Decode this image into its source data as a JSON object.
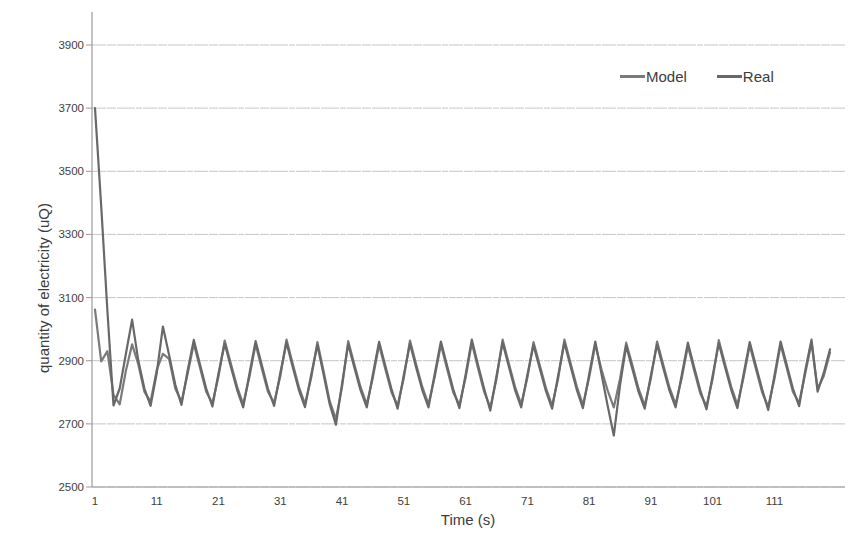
{
  "chart_data": {
    "type": "line",
    "title": "",
    "xlabel": "Time (s)",
    "ylabel": "quantity of electricity (uQ)",
    "x_start": 1,
    "x_ticks": [
      1,
      11,
      21,
      31,
      41,
      51,
      61,
      71,
      81,
      91,
      101,
      111
    ],
    "y_ticks": [
      2500,
      2700,
      2900,
      3100,
      3300,
      3500,
      3700,
      3900
    ],
    "ylim": [
      2500,
      3980
    ],
    "xlim": [
      1,
      120
    ],
    "grid": "horizontal-only",
    "legend_position": "top-right-inside",
    "colors": {
      "grid": "#c6c6c6",
      "axis": "#9b9b9b",
      "text": "#3e3e3e"
    },
    "series": [
      {
        "name": "Model",
        "color": "#7a7a7a",
        "values": [
          3062,
          2898,
          2930,
          2792,
          2762,
          2868,
          2952,
          2890,
          2802,
          2770,
          2872,
          2922,
          2906,
          2812,
          2770,
          2858,
          2954,
          2878,
          2802,
          2765,
          2850,
          2964,
          2890,
          2818,
          2762,
          2848,
          2952,
          2875,
          2802,
          2767,
          2851,
          2967,
          2892,
          2818,
          2763,
          2846,
          2959,
          2868,
          2772,
          2715,
          2818,
          2962,
          2888,
          2816,
          2762,
          2847,
          2950,
          2874,
          2800,
          2758,
          2845,
          2964,
          2888,
          2816,
          2762,
          2848,
          2951,
          2874,
          2800,
          2760,
          2846,
          2957,
          2878,
          2802,
          2752,
          2842,
          2967,
          2892,
          2818,
          2762,
          2846,
          2959,
          2886,
          2814,
          2758,
          2844,
          2967,
          2892,
          2818,
          2760,
          2846,
          2951,
          2872,
          2806,
          2752,
          2842,
          2957,
          2885,
          2812,
          2758,
          2844,
          2961,
          2888,
          2816,
          2762,
          2846,
          2947,
          2870,
          2796,
          2756,
          2842,
          2965,
          2890,
          2818,
          2760,
          2846,
          2949,
          2874,
          2800,
          2754,
          2842,
          2951,
          2876,
          2802,
          2766,
          2860,
          2957,
          2812,
          2852,
          2926
        ]
      },
      {
        "name": "Real",
        "color": "#686868",
        "values": [
          3700,
          3390,
          3058,
          2758,
          2812,
          2922,
          3030,
          2902,
          2812,
          2757,
          2862,
          3008,
          2918,
          2824,
          2760,
          2868,
          2966,
          2888,
          2812,
          2755,
          2860,
          2954,
          2880,
          2808,
          2752,
          2858,
          2962,
          2886,
          2812,
          2757,
          2861,
          2957,
          2882,
          2808,
          2753,
          2856,
          2949,
          2858,
          2762,
          2697,
          2828,
          2952,
          2878,
          2806,
          2752,
          2857,
          2960,
          2884,
          2810,
          2748,
          2855,
          2954,
          2878,
          2806,
          2752,
          2858,
          2961,
          2884,
          2810,
          2750,
          2856,
          2967,
          2888,
          2812,
          2742,
          2852,
          2957,
          2882,
          2808,
          2752,
          2856,
          2949,
          2876,
          2804,
          2748,
          2854,
          2957,
          2882,
          2808,
          2750,
          2856,
          2961,
          2858,
          2758,
          2663,
          2822,
          2947,
          2874,
          2802,
          2748,
          2854,
          2951,
          2878,
          2806,
          2752,
          2856,
          2957,
          2880,
          2806,
          2746,
          2852,
          2955,
          2880,
          2808,
          2750,
          2856,
          2959,
          2884,
          2810,
          2744,
          2852,
          2961,
          2886,
          2812,
          2756,
          2870,
          2967,
          2802,
          2862,
          2936
        ]
      }
    ]
  }
}
